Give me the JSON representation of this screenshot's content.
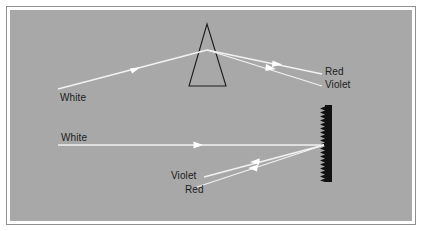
{
  "figure": {
    "background_color": "#a8a8a8",
    "page_color": "#ffffff",
    "border_color": "#8f8f8f",
    "ray_color": "#f2f2f2",
    "ink_color": "#1c1c1c"
  },
  "labels": {
    "prism_incoming": "White",
    "prism_outgoing_top": "Red",
    "prism_outgoing_bottom": "Violet",
    "grating_incoming": "White",
    "grating_outgoing_top": "Violet",
    "grating_outgoing_bottom": "Red"
  },
  "optics": {
    "prism": {
      "name": "triangular-prism",
      "apex": {
        "x": 207,
        "y": 24
      },
      "base_left": {
        "x": 189,
        "y": 86
      },
      "base_right": {
        "x": 226,
        "y": 86
      },
      "stroke": "#1c1c1c"
    },
    "grating": {
      "name": "diffraction-grating",
      "x": 325,
      "top_y": 105,
      "bottom_y": 182,
      "bar_width": 7,
      "tooth_count": 19,
      "tooth_length": 5,
      "fill": "#111111"
    },
    "rays": [
      {
        "name": "prism-incident-white",
        "label": "White",
        "from": {
          "x": 58,
          "y": 89
        },
        "to": {
          "x": 207,
          "y": 50
        },
        "arrow_at": {
          "x": 135,
          "y": 70
        }
      },
      {
        "name": "prism-refracted-red",
        "label": "Red",
        "from": {
          "x": 207,
          "y": 50
        },
        "to": {
          "x": 320,
          "y": 74
        },
        "arrow_at": {
          "x": 277,
          "y": 65
        }
      },
      {
        "name": "prism-refracted-violet",
        "label": "Violet",
        "from": {
          "x": 207,
          "y": 50
        },
        "to": {
          "x": 320,
          "y": 85
        },
        "arrow_at": {
          "x": 271,
          "y": 70
        }
      },
      {
        "name": "grating-incident-white",
        "label": "White",
        "from": {
          "x": 58,
          "y": 145
        },
        "to": {
          "x": 324,
          "y": 145
        },
        "arrow_at": {
          "x": 198,
          "y": 145
        }
      },
      {
        "name": "grating-diffracted-violet",
        "label": "Violet",
        "from": {
          "x": 324,
          "y": 145
        },
        "to": {
          "x": 206,
          "y": 176
        },
        "arrow_at": {
          "x": 255,
          "y": 163
        }
      },
      {
        "name": "grating-diffracted-red",
        "label": "Red",
        "from": {
          "x": 324,
          "y": 145
        },
        "to": {
          "x": 199,
          "y": 186
        },
        "arrow_at": {
          "x": 253,
          "y": 169
        }
      }
    ]
  }
}
